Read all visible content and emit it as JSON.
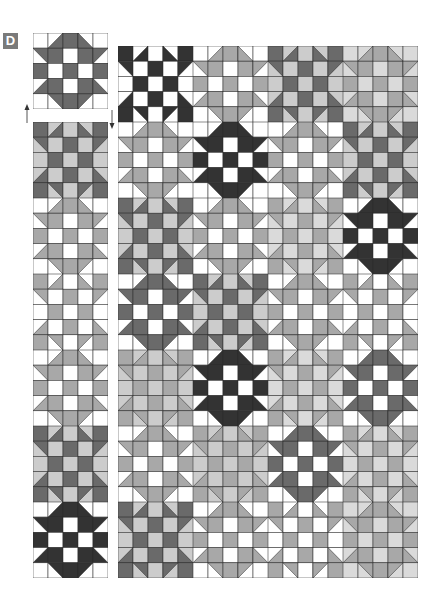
{
  "label": {
    "text": "D"
  },
  "colors": {
    "black": "#333333",
    "dark": "#6a6a6a",
    "mid": "#a8a8a8",
    "light": "#cccccc",
    "pale": "#dadada",
    "white": "#ffffff",
    "outline": "#2a2a2a",
    "label_bg": "#7a7a7a"
  },
  "block_patterns": {
    "A_note": "Star block: 'f' = star fabric, 'b' = background; HST codes give which corner holds star fabric",
    "A": [
      [
        "b",
        "hst_br",
        "f",
        "hst_bl",
        "b"
      ],
      [
        "hst_tr",
        "f",
        "b",
        "f",
        "hst_tl"
      ],
      [
        "f",
        "b",
        "f",
        "b",
        "f"
      ],
      [
        "hst_br",
        "f",
        "b",
        "f",
        "hst_bl"
      ],
      [
        "b",
        "hst_tr",
        "f",
        "hst_tl",
        "b"
      ]
    ],
    "B": [
      [
        "f",
        "hst_br",
        "b",
        "hst_bl",
        "f"
      ],
      [
        "hst_tr",
        "b",
        "f",
        "b",
        "hst_tl"
      ],
      [
        "b",
        "f",
        "b",
        "f",
        "b"
      ],
      [
        "hst_br",
        "b",
        "f",
        "b",
        "hst_bl"
      ],
      [
        "f",
        "hst_tr",
        "b",
        "hst_tl",
        "f"
      ]
    ]
  },
  "single_block": {
    "type": "A",
    "f": "dark",
    "b": "white"
  },
  "arrows": [
    {
      "direction": "up",
      "name": "arrow-up"
    },
    {
      "direction": "down",
      "name": "arrow-down"
    }
  ],
  "strip": {
    "blocks": [
      {
        "type": "B",
        "f": "dark",
        "b": "light"
      },
      {
        "type": "A",
        "f": "mid",
        "b": "white"
      },
      {
        "type": "B",
        "f": "mid",
        "b": "white"
      },
      {
        "type": "A",
        "f": "mid",
        "b": "white"
      },
      {
        "type": "B",
        "f": "dark",
        "b": "light"
      },
      {
        "type": "A",
        "f": "black",
        "b": "white"
      }
    ]
  },
  "quilt": {
    "cols": 4,
    "rows": 7,
    "blocks": [
      [
        {
          "type": "B",
          "f": "black",
          "b": "white"
        },
        {
          "type": "A",
          "f": "mid",
          "b": "white"
        },
        {
          "type": "B",
          "f": "dark",
          "b": "light"
        },
        {
          "type": "A",
          "f": "mid",
          "b": "pale"
        }
      ],
      [
        {
          "type": "A",
          "f": "mid",
          "b": "white"
        },
        {
          "type": "A",
          "f": "black",
          "b": "white"
        },
        {
          "type": "A",
          "f": "mid",
          "b": "white"
        },
        {
          "type": "B",
          "f": "dark",
          "b": "light"
        }
      ],
      [
        {
          "type": "B",
          "f": "dark",
          "b": "light"
        },
        {
          "type": "A",
          "f": "mid",
          "b": "white"
        },
        {
          "type": "B",
          "f": "mid",
          "b": "pale"
        },
        {
          "type": "A",
          "f": "black",
          "b": "white"
        }
      ],
      [
        {
          "type": "A",
          "f": "dark",
          "b": "white"
        },
        {
          "type": "B",
          "f": "dark",
          "b": "light"
        },
        {
          "type": "A",
          "f": "mid",
          "b": "white"
        },
        {
          "type": "B",
          "f": "mid",
          "b": "white"
        }
      ],
      [
        {
          "type": "B",
          "f": "mid",
          "b": "light"
        },
        {
          "type": "A",
          "f": "black",
          "b": "white"
        },
        {
          "type": "B",
          "f": "mid",
          "b": "pale"
        },
        {
          "type": "A",
          "f": "dark",
          "b": "white"
        }
      ],
      [
        {
          "type": "A",
          "f": "mid",
          "b": "white"
        },
        {
          "type": "B",
          "f": "mid",
          "b": "light"
        },
        {
          "type": "A",
          "f": "dark",
          "b": "white"
        },
        {
          "type": "B",
          "f": "mid",
          "b": "pale"
        }
      ],
      [
        {
          "type": "B",
          "f": "dark",
          "b": "light"
        },
        {
          "type": "A",
          "f": "mid",
          "b": "white"
        },
        {
          "type": "B",
          "f": "mid",
          "b": "white"
        },
        {
          "type": "A",
          "f": "mid",
          "b": "pale"
        }
      ]
    ]
  }
}
